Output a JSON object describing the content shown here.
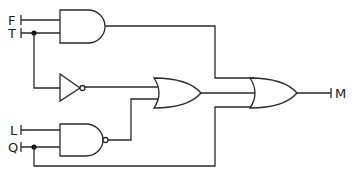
{
  "diagram": {
    "type": "logic-circuit",
    "inputs": [
      {
        "id": "F",
        "label": "F"
      },
      {
        "id": "T",
        "label": "T"
      },
      {
        "id": "L",
        "label": "L"
      },
      {
        "id": "Q",
        "label": "Q"
      }
    ],
    "outputs": [
      {
        "id": "M",
        "label": "M"
      }
    ],
    "gates": [
      {
        "id": "and1",
        "type": "AND",
        "inputs": [
          "F",
          "T"
        ]
      },
      {
        "id": "not1",
        "type": "NOT",
        "inputs": [
          "T"
        ]
      },
      {
        "id": "nand1",
        "type": "NAND",
        "inputs": [
          "L",
          "Q"
        ]
      },
      {
        "id": "or1",
        "type": "OR",
        "inputs": [
          "not1",
          "nand1"
        ]
      },
      {
        "id": "or2",
        "type": "OR",
        "inputs": [
          "and1",
          "or1",
          "Q"
        ],
        "output": "M"
      }
    ],
    "colors": {
      "line": "#2a2a2a",
      "background": "#ffffff"
    }
  }
}
